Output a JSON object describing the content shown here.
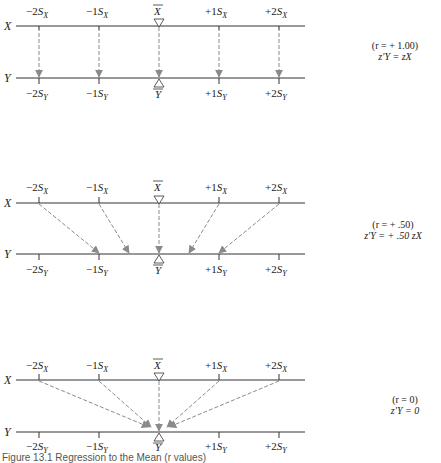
{
  "panels": [
    {
      "name": "r-plus-1",
      "x_axis_label": "X",
      "y_axis_label": "Y",
      "x_ticks": [
        "−2S",
        "−1S",
        "X̄",
        "+1S",
        "+2S"
      ],
      "annotation_line1": "(r = + 1.00)",
      "annotation_line2": "z′Y = zX"
    },
    {
      "name": "r-plus-050",
      "x_axis_label": "X",
      "y_axis_label": "Y",
      "annotation_line1": "(r = + .50)",
      "annotation_line2": "z′Y = + .50 zX"
    },
    {
      "name": "r-zero",
      "x_axis_label": "X",
      "y_axis_label": "Y",
      "annotation_line1": "(r = 0)",
      "annotation_line2": "z′Y = 0"
    }
  ],
  "tick_labels_x": [
    "−2S",
    "−1S",
    "+1S",
    "+2S"
  ],
  "tick_sub_x": "X",
  "tick_sub_y": "Y",
  "mean_x": "X",
  "mean_y": "Y",
  "caption": "Figure 13.1 Regression to the Mean (r values)",
  "colors": {
    "line": "#333333",
    "arrow": "#8a8a8a"
  }
}
